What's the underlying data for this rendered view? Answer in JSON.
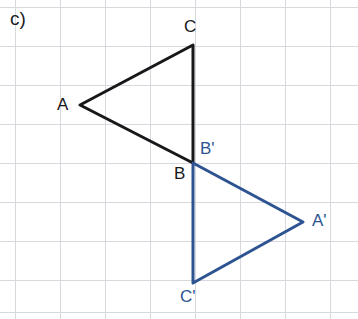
{
  "problem": {
    "label": "c)"
  },
  "canvas": {
    "width": 358,
    "height": 319,
    "background_color": "#ffffff"
  },
  "grid": {
    "cell_width": 45,
    "cell_height": 39,
    "origin_x": 15,
    "origin_y": 7,
    "line_color": "#d8d9de",
    "line_width": 1,
    "visible": true
  },
  "figures": [
    {
      "name": "triangle-abc",
      "role": "pre-image",
      "color": "#16181a",
      "stroke_width": 3,
      "closed": true,
      "vertices": [
        {
          "label": "A",
          "x": 80,
          "y": 105
        },
        {
          "label": "C",
          "x": 193,
          "y": 45
        },
        {
          "label": "B",
          "x": 193,
          "y": 163
        }
      ]
    },
    {
      "name": "triangle-a-prime-b-prime-c-prime",
      "role": "image",
      "color": "#2d5490",
      "stroke_width": 3,
      "closed": true,
      "vertices": [
        {
          "label": "B'",
          "x": 193,
          "y": 163
        },
        {
          "label": "A'",
          "x": 303,
          "y": 222
        },
        {
          "label": "C'",
          "x": 193,
          "y": 283
        }
      ]
    }
  ],
  "labels": [
    {
      "name": "label-A",
      "text": "A",
      "color": "#16181a",
      "x": 57,
      "y": 96
    },
    {
      "name": "label-C",
      "text": "C",
      "color": "#16181a",
      "x": 184,
      "y": 18
    },
    {
      "name": "label-B",
      "text": "B",
      "color": "#16181a",
      "x": 174,
      "y": 165
    },
    {
      "name": "label-Bp",
      "text": "B'",
      "color": "#2d5490",
      "x": 200,
      "y": 140
    },
    {
      "name": "label-Ap",
      "text": "A'",
      "color": "#2d5490",
      "x": 312,
      "y": 212
    },
    {
      "name": "label-Cp",
      "text": "C'",
      "color": "#2d5490",
      "x": 180,
      "y": 288
    }
  ],
  "chart_data": {
    "type": "scatter",
    "title": "",
    "xlabel": "",
    "ylabel": "",
    "grid": true,
    "legend": "none",
    "xlim": [
      0,
      358
    ],
    "ylim": [
      319,
      0
    ],
    "series": [
      {
        "name": "Triangle ABC",
        "color": "#16181a",
        "closed": true,
        "point_labels": [
          "A",
          "C",
          "B"
        ],
        "x": [
          80,
          193,
          193
        ],
        "y": [
          105,
          45,
          163
        ]
      },
      {
        "name": "Triangle A'B'C'",
        "color": "#2d5490",
        "closed": true,
        "point_labels": [
          "B'",
          "A'",
          "C'"
        ],
        "x": [
          193,
          303,
          193
        ],
        "y": [
          163,
          222,
          283
        ]
      }
    ],
    "annotations": [
      {
        "text": "c)",
        "x": 10,
        "y": 9
      }
    ]
  }
}
